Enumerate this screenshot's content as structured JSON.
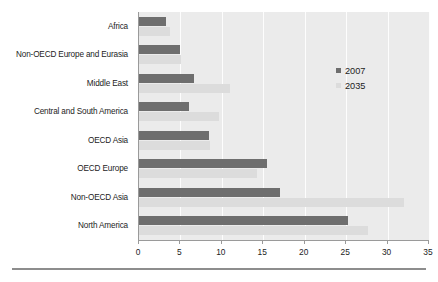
{
  "chart_data": {
    "type": "bar",
    "orientation": "horizontal",
    "title": "",
    "xlabel": "",
    "ylabel": "",
    "xlim": [
      0,
      35
    ],
    "xticks": [
      0,
      5,
      10,
      15,
      20,
      25,
      30,
      35
    ],
    "grid": true,
    "legend_position": "inside-upper-right",
    "categories": [
      "Africa",
      "Non-OECD Europe and Eurasia",
      "Middle East",
      "Central and South America",
      "OECD Asia",
      "OECD Europe",
      "Non-OECD Asia",
      "North America"
    ],
    "series": [
      {
        "name": "2007",
        "color": "#6e6e6e",
        "values": [
          3.2,
          5.0,
          6.6,
          6.0,
          8.5,
          15.5,
          17.0,
          25.2
        ]
      },
      {
        "name": "2035",
        "color": "#dcdcdc",
        "values": [
          3.8,
          5.1,
          11.0,
          9.6,
          8.6,
          14.3,
          32.0,
          27.6
        ]
      }
    ]
  },
  "legend": {
    "entries": [
      {
        "label": "2007",
        "swatch": "s2007"
      },
      {
        "label": "2035",
        "swatch": "s2035"
      }
    ]
  },
  "footer": {
    "caption": ""
  }
}
